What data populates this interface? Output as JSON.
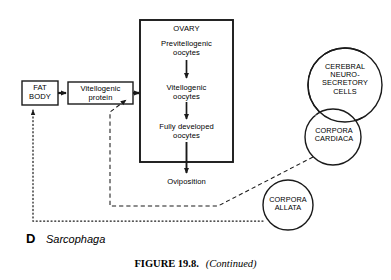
{
  "figure": {
    "panel_letter": "D",
    "species": "Sarcophaga",
    "caption_number": "FIGURE 19.8.",
    "caption_note": "(Continued)"
  },
  "diagram": {
    "type": "flow-diagram",
    "boxes": [
      {
        "id": "fat-body",
        "label": "FAT\nBODY",
        "x": 22,
        "y": 81,
        "w": 36,
        "h": 24
      },
      {
        "id": "vitellogenic-protein",
        "label": "Vitellogenic\nprotein",
        "x": 68,
        "y": 82,
        "w": 65,
        "h": 22
      },
      {
        "id": "ovary",
        "label": "OVARY",
        "x": 140,
        "y": 20,
        "w": 93,
        "h": 142
      }
    ],
    "ovary_stages": [
      {
        "id": "previtellogenic-oocytes",
        "label": "Previtellogenic\noocytes"
      },
      {
        "id": "vitellogenic-oocytes",
        "label": "Vitellogenic\noocytes"
      },
      {
        "id": "fully-developed-oocytes",
        "label": "Fully developed\noocytes"
      }
    ],
    "outcome": {
      "id": "oviposition",
      "label": "Oviposition"
    },
    "circles": [
      {
        "id": "cerebral-neurosecretory-cells",
        "label": "CEREBRAL\nNEURO-\nSECRETORY\nCELLS",
        "cx": 345,
        "cy": 85,
        "r": 37
      },
      {
        "id": "corpora-cardiaca",
        "label": "CORPORA\nCARDIACA",
        "cx": 333,
        "cy": 137,
        "r": 28
      },
      {
        "id": "corpora-allata",
        "label": "CORPORA\nALLATA",
        "cx": 288,
        "cy": 205,
        "r": 25
      }
    ],
    "line_styles": {
      "solid": "solid arrow — material flow",
      "dashed": "dashed line — corpora cardiaca stimulation of vitellogenic protein",
      "dotted": "dotted line — corpora allata stimulation of fat body"
    },
    "colors": {
      "stroke": "#1a1a1a",
      "background": "#ffffff"
    }
  }
}
